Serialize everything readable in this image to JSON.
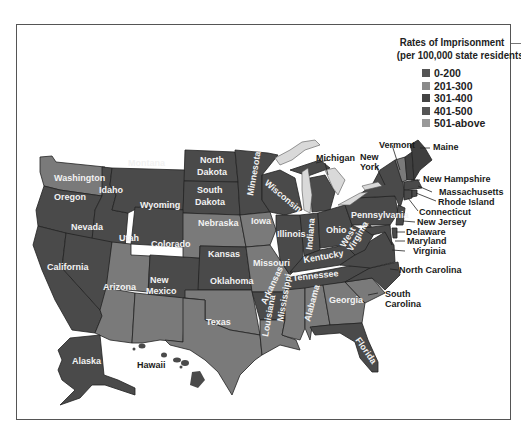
{
  "legend": {
    "title_line1": "Rates of Imprisonment",
    "title_line2": "(per 100,000 state residents)",
    "items": [
      {
        "label": "0-200",
        "color": "#555555"
      },
      {
        "label": "201-300",
        "color": "#8a8a8a"
      },
      {
        "label": "301-400",
        "color": "#444444"
      },
      {
        "label": "401-500",
        "color": "#555555"
      },
      {
        "label": "501-above",
        "color": "#999999"
      }
    ]
  },
  "colors": {
    "dark": "#4a4a4a",
    "darker": "#3f3f3f",
    "mid": "#7a7a7a",
    "light": "#8c8c8c",
    "lake": "#d9d9d9"
  },
  "states": {
    "washington": "Washington",
    "oregon": "Oregon",
    "california": "California",
    "idaho": "Idaho",
    "nevada": "Nevada",
    "montana": "Montana",
    "wyoming": "Wyoming",
    "utah": "Utah",
    "arizona": "Arizona",
    "colorado": "Colorado",
    "new_mexico_1": "New",
    "new_mexico_2": "Mexico",
    "north_dakota_1": "North",
    "north_dakota_2": "Dakota",
    "south_dakota_1": "South",
    "south_dakota_2": "Dakota",
    "nebraska": "Nebraska",
    "kansas": "Kansas",
    "oklahoma": "Oklahoma",
    "texas": "Texas",
    "minnesota": "Minnesota",
    "iowa": "Iowa",
    "missouri": "Missouri",
    "arkansas": "Arkansas",
    "louisiana": "Louisiana",
    "wisconsin": "Wisconsin",
    "illinois": "Illinois",
    "michigan": "Michigan",
    "indiana": "Indiana",
    "ohio": "Ohio",
    "kentucky": "Kentucky",
    "tennessee": "Tennessee",
    "mississippi": "Mississippi",
    "alabama": "Alabama",
    "georgia": "Georgia",
    "florida": "Florida",
    "south_carolina_1": "South",
    "south_carolina_2": "Carolina",
    "north_carolina": "North Carolina",
    "virginia": "Virginia",
    "west_virginia_1": "West",
    "west_virginia_2": "Virginia",
    "pennsylvania": "Pennsylvania",
    "new_york_1": "New",
    "new_york_2": "York",
    "vermont": "Vermont",
    "maine": "Maine",
    "new_hampshire": "New Hampshire",
    "massachusetts": "Massachusetts",
    "rhode_island": "Rhode Island",
    "connecticut": "Connecticut",
    "new_jersey": "New Jersey",
    "delaware": "Delaware",
    "maryland": "Maryland",
    "alaska": "Alaska",
    "hawaii": "Hawaii"
  }
}
